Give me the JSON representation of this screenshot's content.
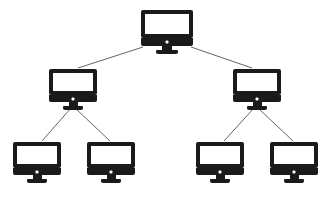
{
  "diagram": {
    "title_fragment": "",
    "type": "hierarchical-tree",
    "background_color": "#ffffff",
    "node_color": "#1a1a1a",
    "screen_color": "#ffffff",
    "edge_color": "#3c3c3c",
    "edge_width": 0.8,
    "levels": 3,
    "node_count": 7,
    "edge_count": 6,
    "node_icon": "computer-monitor-icon",
    "nodes": [
      {
        "id": "root",
        "label": "",
        "level": 0,
        "x": 141,
        "y": 10,
        "w": 52,
        "h": 38,
        "bezel_h": 28,
        "bar_h": 8,
        "neck_w": 10,
        "neck_h": 4,
        "base_w": 22,
        "base_h": 4,
        "dot_w": 3,
        "dot_h": 3
      },
      {
        "id": "branch-left",
        "label": "",
        "level": 1,
        "x": 49,
        "y": 69,
        "w": 48,
        "h": 36,
        "bezel_h": 26,
        "bar_h": 7,
        "neck_w": 9,
        "neck_h": 4,
        "base_w": 20,
        "base_h": 4,
        "dot_w": 3,
        "dot_h": 3
      },
      {
        "id": "branch-right",
        "label": "",
        "level": 1,
        "x": 233,
        "y": 69,
        "w": 48,
        "h": 36,
        "bezel_h": 26,
        "bar_h": 7,
        "neck_w": 9,
        "neck_h": 4,
        "base_w": 20,
        "base_h": 4,
        "dot_w": 3,
        "dot_h": 3
      },
      {
        "id": "leaf-1",
        "label": "",
        "level": 2,
        "x": 13,
        "y": 142,
        "w": 48,
        "h": 36,
        "bezel_h": 26,
        "bar_h": 7,
        "neck_w": 9,
        "neck_h": 4,
        "base_w": 20,
        "base_h": 4,
        "dot_w": 3,
        "dot_h": 3
      },
      {
        "id": "leaf-2",
        "label": "",
        "level": 2,
        "x": 87,
        "y": 142,
        "w": 48,
        "h": 36,
        "bezel_h": 26,
        "bar_h": 7,
        "neck_w": 9,
        "neck_h": 4,
        "base_w": 20,
        "base_h": 4,
        "dot_w": 3,
        "dot_h": 3
      },
      {
        "id": "leaf-3",
        "label": "",
        "level": 2,
        "x": 196,
        "y": 142,
        "w": 48,
        "h": 36,
        "bezel_h": 26,
        "bar_h": 7,
        "neck_w": 9,
        "neck_h": 4,
        "base_w": 20,
        "base_h": 4,
        "dot_w": 3,
        "dot_h": 3
      },
      {
        "id": "leaf-4",
        "label": "",
        "level": 2,
        "x": 270,
        "y": 142,
        "w": 48,
        "h": 36,
        "bezel_h": 26,
        "bar_h": 7,
        "neck_w": 9,
        "neck_h": 4,
        "base_w": 20,
        "base_h": 4,
        "dot_w": 3,
        "dot_h": 3
      }
    ],
    "edges": [
      {
        "id": "edge-root-left",
        "from": "root",
        "to": "branch-left",
        "x1": 143,
        "y1": 47,
        "x2": 78,
        "y2": 68
      },
      {
        "id": "edge-root-right",
        "from": "root",
        "to": "branch-right",
        "x1": 191,
        "y1": 47,
        "x2": 252,
        "y2": 68
      },
      {
        "id": "edge-left-1",
        "from": "branch-left",
        "to": "leaf-1",
        "x1": 71,
        "y1": 108,
        "x2": 42,
        "y2": 141
      },
      {
        "id": "edge-left-2",
        "from": "branch-left",
        "to": "leaf-2",
        "x1": 75,
        "y1": 108,
        "x2": 110,
        "y2": 141
      },
      {
        "id": "edge-right-3",
        "from": "branch-right",
        "to": "leaf-3",
        "x1": 254,
        "y1": 108,
        "x2": 224,
        "y2": 141
      },
      {
        "id": "edge-right-4",
        "from": "branch-right",
        "to": "leaf-4",
        "x1": 258,
        "y1": 108,
        "x2": 293,
        "y2": 141
      }
    ]
  }
}
